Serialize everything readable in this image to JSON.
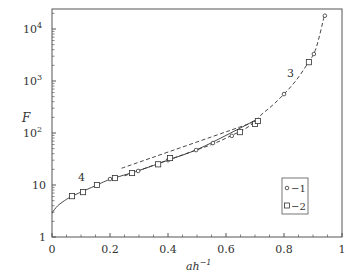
{
  "chart_data": {
    "type": "line",
    "title": "",
    "xlabel": "ah",
    "xlabel_sup": "−1",
    "ylabel": "F",
    "xlim": [
      0,
      1
    ],
    "ylim": [
      1,
      25000
    ],
    "yscale": "log",
    "grid": false,
    "legend_position": "lower right",
    "x_ticks": [
      0,
      0.2,
      0.4,
      0.6,
      0.8,
      1
    ],
    "x_tick_labels": [
      "0",
      "0.2",
      "0.4",
      "0.6",
      "0.8",
      "1"
    ],
    "y_ticks": [
      1,
      10,
      100,
      1000,
      10000
    ],
    "y_tick_labels": [
      {
        "base": "1",
        "exp": ""
      },
      {
        "base": "10",
        "exp": ""
      },
      {
        "base": "10",
        "exp": "2"
      },
      {
        "base": "10",
        "exp": "3"
      },
      {
        "base": "10",
        "exp": "4"
      }
    ],
    "series": [
      {
        "name": "1",
        "legend_label": "−1",
        "marker": "circle",
        "x": [
          0.2,
          0.297,
          0.4,
          0.497,
          0.555,
          0.62,
          0.8,
          0.903,
          0.941
        ],
        "y": [
          13,
          18.6,
          30,
          47,
          64,
          88,
          560,
          3300,
          18000
        ]
      },
      {
        "name": "2",
        "legend_label": "−2",
        "marker": "square",
        "x": [
          0.069,
          0.107,
          0.155,
          0.217,
          0.276,
          0.366,
          0.407,
          0.648,
          0.7,
          0.71,
          0.886
        ],
        "y": [
          6.1,
          7.3,
          10,
          13.6,
          17,
          25,
          33,
          104,
          149,
          170,
          2300
        ]
      }
    ],
    "curves": [
      {
        "name": "3",
        "style": "dashed",
        "label_position": {
          "x": 0.81,
          "y": 1200
        },
        "x": [
          0.25,
          0.35,
          0.45,
          0.55,
          0.62,
          0.68,
          0.72,
          0.76,
          0.8,
          0.84,
          0.88,
          0.91,
          0.94
        ],
        "y": [
          15,
          24,
          38,
          60,
          90,
          135,
          220,
          340,
          560,
          1000,
          2100,
          4200,
          19000
        ]
      },
      {
        "name": "4",
        "style": "solid",
        "label_position": {
          "x": 0.095,
          "y": 11.5
        },
        "x": [
          0,
          0.02,
          0.05,
          0.07,
          0.1,
          0.15,
          0.2,
          0.3,
          0.4,
          0.5,
          0.6,
          0.7
        ],
        "y": [
          2.9,
          4.0,
          5.3,
          6.1,
          7.3,
          9.7,
          12.8,
          19,
          30,
          48,
          90,
          175
        ]
      },
      {
        "name": "straight-fit",
        "style": "dashed",
        "x": [
          0.24,
          0.72
        ],
        "y": [
          21,
          180
        ]
      }
    ]
  },
  "annotations": {
    "curve3_label": "3",
    "curve4_label": "4"
  },
  "legend": {
    "item1": "−1",
    "item2": "−2"
  },
  "colors": {
    "axis": "#555555",
    "line": "#333333",
    "background": "#ffffff"
  }
}
